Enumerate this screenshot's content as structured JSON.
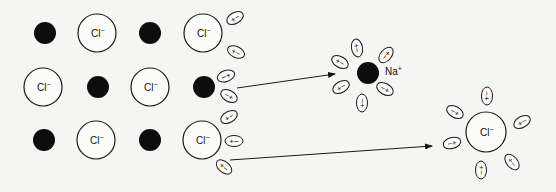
{
  "diagram": {
    "labels": {
      "chloride": "Cl",
      "chloride_charge": "−",
      "sodium": "Na",
      "sodium_charge": "+"
    },
    "lattice": [
      {
        "type": "Na",
        "x": 45,
        "y": 33
      },
      {
        "type": "Cl",
        "x": 97,
        "y": 33
      },
      {
        "type": "Na",
        "x": 150,
        "y": 33
      },
      {
        "type": "Cl",
        "x": 203,
        "y": 33
      },
      {
        "type": "Cl",
        "x": 43,
        "y": 87
      },
      {
        "type": "Na",
        "x": 98,
        "y": 87
      },
      {
        "type": "Cl",
        "x": 150,
        "y": 87
      },
      {
        "type": "Na",
        "x": 204,
        "y": 87
      },
      {
        "type": "Na",
        "x": 44,
        "y": 140
      },
      {
        "type": "Cl",
        "x": 96,
        "y": 140
      },
      {
        "type": "Na",
        "x": 150,
        "y": 140
      },
      {
        "type": "Cl",
        "x": 202,
        "y": 140
      }
    ],
    "lattice_water": [
      {
        "x": 235,
        "y": 18,
        "angle": -30,
        "text": "+−"
      },
      {
        "x": 236,
        "y": 52,
        "angle": 25,
        "text": "+−"
      },
      {
        "x": 226,
        "y": 76,
        "angle": -20,
        "text": "−+"
      },
      {
        "x": 229,
        "y": 96,
        "angle": 30,
        "text": "−+"
      },
      {
        "x": 229,
        "y": 117,
        "angle": -30,
        "text": "+−"
      },
      {
        "x": 234,
        "y": 141,
        "angle": 0,
        "text": "+−"
      },
      {
        "x": 224,
        "y": 167,
        "angle": 40,
        "text": "+−"
      }
    ],
    "arrows": [
      {
        "x1": 237,
        "y1": 88,
        "x2": 335,
        "y2": 74
      },
      {
        "x1": 230,
        "y1": 160,
        "x2": 432,
        "y2": 146
      }
    ],
    "hydrated_sodium": {
      "x": 368,
      "y": 73,
      "r": 11,
      "label_x": 385,
      "label_y": 75,
      "water": [
        {
          "x": 357,
          "y": 48,
          "angle": 80,
          "text": "+−"
        },
        {
          "x": 340,
          "y": 62,
          "angle": 30,
          "text": "+−"
        },
        {
          "x": 341,
          "y": 87,
          "angle": -30,
          "text": "+−"
        },
        {
          "x": 362,
          "y": 103,
          "angle": -90,
          "text": "+−"
        },
        {
          "x": 385,
          "y": 89,
          "angle": 30,
          "text": "−+"
        },
        {
          "x": 386,
          "y": 55,
          "angle": -50,
          "text": "−+"
        }
      ]
    },
    "hydrated_chloride": {
      "x": 486,
      "y": 132,
      "r": 20,
      "water": [
        {
          "x": 487,
          "y": 96,
          "angle": 90,
          "text": "−+"
        },
        {
          "x": 455,
          "y": 112,
          "angle": 30,
          "text": "−+"
        },
        {
          "x": 452,
          "y": 143,
          "angle": -15,
          "text": "−+"
        },
        {
          "x": 481,
          "y": 170,
          "angle": -90,
          "text": "−+"
        },
        {
          "x": 512,
          "y": 162,
          "angle": 50,
          "text": "+−"
        },
        {
          "x": 522,
          "y": 122,
          "angle": -30,
          "text": "+−"
        }
      ]
    }
  }
}
